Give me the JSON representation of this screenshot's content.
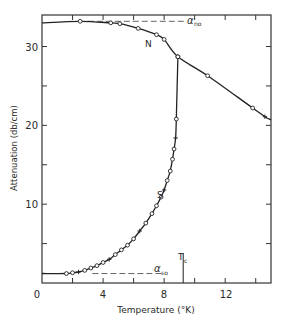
{
  "chart_data": {
    "type": "line",
    "title": "",
    "xlabel": "Temperature (°K)",
    "ylabel": "Attenuation (db/cm)",
    "xlim": [
      0,
      15
    ],
    "ylim": [
      0,
      34
    ],
    "xticks": [
      0,
      4,
      8,
      12
    ],
    "xticks_minor": [
      2,
      6,
      10,
      14
    ],
    "yticks": [
      10,
      20,
      30
    ],
    "yticks_minor": [
      5,
      15,
      25
    ],
    "grid": false,
    "legend": null,
    "series": [
      {
        "name": "N",
        "label": "N",
        "style": "solid line with open circle markers",
        "x": [
          0,
          2.5,
          4.5,
          5.1,
          6.3,
          7.5,
          8.0,
          8.9,
          10.85,
          13.8,
          14.6,
          15.0
        ],
        "y": [
          33.0,
          33.2,
          33.0,
          32.9,
          32.3,
          31.5,
          30.9,
          28.7,
          26.3,
          22.2,
          21.1,
          20.7
        ]
      },
      {
        "name": "S",
        "label": "S",
        "style": "solid line with open circle and cross markers",
        "x": [
          0,
          1.6,
          2.0,
          2.4,
          2.8,
          3.2,
          3.6,
          4.0,
          4.4,
          4.8,
          5.2,
          5.6,
          6.0,
          6.4,
          6.8,
          7.2,
          7.5,
          7.8,
          8.0,
          8.2,
          8.4,
          8.55,
          8.65,
          8.75,
          8.8,
          8.9
        ],
        "y": [
          1.2,
          1.2,
          1.3,
          1.4,
          1.6,
          1.9,
          2.2,
          2.6,
          3.0,
          3.6,
          4.2,
          4.8,
          5.6,
          6.6,
          7.6,
          8.8,
          9.8,
          10.9,
          11.8,
          13.0,
          14.2,
          15.7,
          17.0,
          18.4,
          20.8,
          28.7
        ]
      }
    ],
    "annotations": [
      {
        "text": "α_no",
        "main": "α",
        "sub": "no",
        "x": 9.6,
        "y": 33.2,
        "note": "dashed horizontal reference line at normal-state limit"
      },
      {
        "text": "α_so",
        "main": "α",
        "sub": "so",
        "x": 8.3,
        "y": 1.2,
        "note": "dashed horizontal reference line at superconducting-state limit"
      },
      {
        "text": "T_c",
        "main": "T",
        "sub": "c",
        "x": 9.25,
        "y": 3.8,
        "note": "vertical marker at transition temperature"
      },
      {
        "text": "N",
        "x": 8.3,
        "y": 30.0
      },
      {
        "text": "S",
        "x": 7.4,
        "y": 11.6
      }
    ],
    "reference_lines": [
      {
        "name": "alpha_no",
        "orientation": "horizontal",
        "y": 33.2,
        "x_range": [
          3.0,
          9.4
        ],
        "style": "dashed"
      },
      {
        "name": "alpha_so",
        "orientation": "horizontal",
        "y": 1.2,
        "x_range": [
          3.3,
          8.0
        ],
        "style": "dashed"
      },
      {
        "name": "Tc",
        "orientation": "vertical",
        "x": 9.25,
        "y_range": [
          0,
          3.8
        ],
        "style": "solid"
      }
    ]
  },
  "labels": {
    "xlabel": "Temperature (°K)",
    "ylabel": "Attenuation (db/cm)",
    "xtick_0": "0",
    "xtick_4": "4",
    "xtick_8": "8",
    "xtick_12": "12",
    "ytick_10": "10",
    "ytick_20": "20",
    "ytick_30": "30",
    "curve_n": "N",
    "curve_s": "S",
    "alpha": "α",
    "alpha_no_sub": "no",
    "alpha_so_sub": "so",
    "tc_main": "T",
    "tc_sub": "c"
  }
}
